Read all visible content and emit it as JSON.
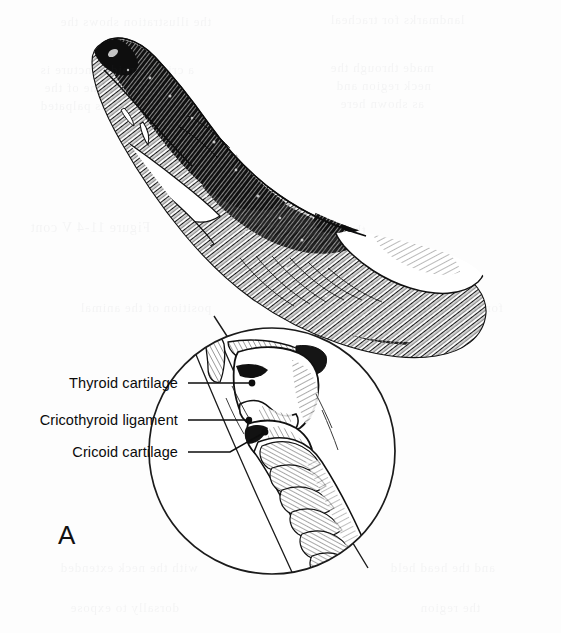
{
  "figure": {
    "panel_letter": "A",
    "background_color": "#fdfdfd",
    "ink_color": "#111111",
    "inset": {
      "name": "laryngeal-region-magnified-inset",
      "shape": "circle",
      "center_x": 272,
      "center_y": 451,
      "radius": 124
    },
    "labels": [
      {
        "id": "thyroid-cartilage",
        "text": "Thyroid cartilage",
        "text_x": 178,
        "text_y": 388,
        "anchor": "end",
        "leader_from_x": 188,
        "leader_from_y": 383,
        "leader_to_x": 252,
        "leader_to_y": 383,
        "dot_x": 252,
        "dot_y": 383
      },
      {
        "id": "cricothyroid-ligament",
        "text": "Cricothyroid ligament",
        "text_x": 178,
        "text_y": 425,
        "anchor": "end",
        "leader_from_x": 188,
        "leader_from_y": 420,
        "leader_to_x": 249,
        "leader_to_y": 420,
        "dot_x": 249,
        "dot_y": 420
      },
      {
        "id": "cricoid-cartilage",
        "text": "Cricoid cartilage",
        "text_x": 178,
        "text_y": 457,
        "anchor": "end",
        "leader_from_x": 188,
        "leader_from_y": 452,
        "leader_to_x": 265,
        "leader_to_y": 432,
        "dot_x": 265,
        "dot_y": 432
      }
    ],
    "panel_letter_x": 58,
    "panel_letter_y": 544,
    "inset_structures": [
      "thyroid-cartilage",
      "cricothyroid-ligament",
      "cricoid-cartilage",
      "tracheal-rings",
      "hyoid-bone"
    ]
  },
  "ghost_text": {
    "note": "faint show-through text from reverse of page, illegible",
    "lines": [
      {
        "text": "the illustration shows the",
        "x": 60,
        "y": 14,
        "size": 13
      },
      {
        "text": "landmarks for tracheal",
        "x": 330,
        "y": 12,
        "size": 13
      },
      {
        "text": "a cricothyroid puncture is",
        "x": 40,
        "y": 62,
        "size": 13
      },
      {
        "text": "made through the",
        "x": 330,
        "y": 60,
        "size": 13
      },
      {
        "text": "ventral midline of the",
        "x": 44,
        "y": 80,
        "size": 13
      },
      {
        "text": "neck region and",
        "x": 336,
        "y": 78,
        "size": 13
      },
      {
        "text": "the larynx is palpated",
        "x": 40,
        "y": 98,
        "size": 13
      },
      {
        "text": "as shown here",
        "x": 340,
        "y": 96,
        "size": 13
      },
      {
        "text": "Figure 11-4 V cont",
        "x": 30,
        "y": 220,
        "size": 14
      },
      {
        "text": "the trachea",
        "x": 300,
        "y": 222,
        "size": 13
      },
      {
        "text": "position of the animal",
        "x": 80,
        "y": 300,
        "size": 13
      },
      {
        "text": "for the procedure",
        "x": 400,
        "y": 300,
        "size": 13
      },
      {
        "text": "with the neck extended",
        "x": 60,
        "y": 560,
        "size": 13
      },
      {
        "text": "and the head held",
        "x": 390,
        "y": 560,
        "size": 13
      },
      {
        "text": "dorsally to expose",
        "x": 70,
        "y": 600,
        "size": 13
      },
      {
        "text": "the region",
        "x": 420,
        "y": 600,
        "size": 13
      }
    ]
  }
}
